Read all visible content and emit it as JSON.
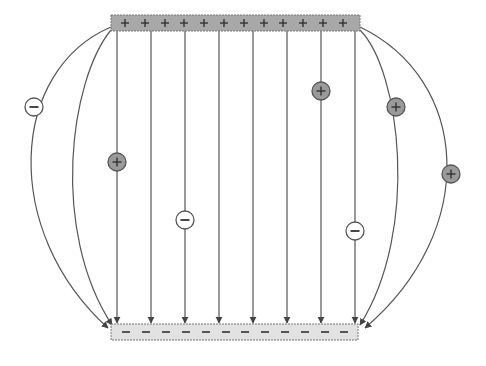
{
  "colors": {
    "background": "#ffffff",
    "positive_plate_fill": "#a8a8a8",
    "negative_plate_fill": "#e2e2e2",
    "plate_stroke": "#777777",
    "field_line": "#555555",
    "positive_charge_fill": "#9a9a9a",
    "negative_charge_fill": "#ffffff",
    "charge_stroke": "#555555",
    "sign_color": "#333333"
  },
  "positive_plate": {
    "x": 111,
    "y": 15,
    "width": 249,
    "height": 16,
    "sign": "+",
    "sign_count": 12,
    "sign_positions_x": [
      125,
      145,
      165,
      184,
      204,
      224,
      244,
      264,
      283,
      303,
      323,
      343
    ]
  },
  "negative_plate": {
    "x": 111,
    "y": 324,
    "width": 247,
    "height": 16,
    "sign": "−",
    "sign_count": 12,
    "sign_positions_x": [
      126,
      146,
      166,
      186,
      206,
      226,
      245,
      265,
      285,
      305,
      325,
      344
    ]
  },
  "field_lines": {
    "straight": [
      {
        "x": 117,
        "y1": 31,
        "y2": 323
      },
      {
        "x": 151,
        "y1": 31,
        "y2": 323
      },
      {
        "x": 185,
        "y1": 31,
        "y2": 323
      },
      {
        "x": 219,
        "y1": 31,
        "y2": 323
      },
      {
        "x": 253,
        "y1": 31,
        "y2": 323
      },
      {
        "x": 287,
        "y1": 31,
        "y2": 323
      },
      {
        "x": 321,
        "y1": 31,
        "y2": 323
      },
      {
        "x": 355,
        "y1": 31,
        "y2": 323
      }
    ],
    "curved": [
      {
        "d": "M 111 27 C 10 70, 0 230, 108 328"
      },
      {
        "d": "M 111 30 C 70 80, 50 230, 112 325"
      },
      {
        "d": "M 360 27 C 470 80, 480 230, 365 328"
      },
      {
        "d": "M 360 30 C 400 70, 420 230, 360 325"
      }
    ]
  },
  "charges": [
    {
      "type": "negative",
      "sign": "−",
      "x": 34,
      "y": 107,
      "r": 9
    },
    {
      "type": "positive",
      "sign": "+",
      "x": 117,
      "y": 162,
      "r": 9
    },
    {
      "type": "negative",
      "sign": "−",
      "x": 185,
      "y": 220,
      "r": 9
    },
    {
      "type": "positive",
      "sign": "+",
      "x": 321,
      "y": 91,
      "r": 9
    },
    {
      "type": "positive",
      "sign": "+",
      "x": 396,
      "y": 107,
      "r": 9
    },
    {
      "type": "negative",
      "sign": "−",
      "x": 355,
      "y": 231,
      "r": 9
    },
    {
      "type": "positive",
      "sign": "+",
      "x": 451,
      "y": 174,
      "r": 9
    }
  ]
}
